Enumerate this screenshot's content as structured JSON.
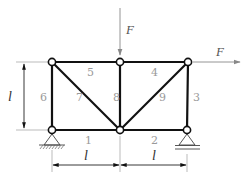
{
  "diagram": {
    "type": "truss",
    "colors": {
      "member": "#111111",
      "force": "#888888",
      "dimension": "#222222",
      "label": "#9a9a9a",
      "extension": "#aaaaaa"
    },
    "nodes": [
      {
        "id": "A",
        "x": 52,
        "y": 62
      },
      {
        "id": "B",
        "x": 120,
        "y": 62
      },
      {
        "id": "C",
        "x": 188,
        "y": 62
      },
      {
        "id": "D",
        "x": 52,
        "y": 130
      },
      {
        "id": "E",
        "x": 120,
        "y": 130
      },
      {
        "id": "G",
        "x": 187,
        "y": 130
      }
    ],
    "members": [
      {
        "label": "1",
        "from": "D",
        "to": "E"
      },
      {
        "label": "2",
        "from": "E",
        "to": "G"
      },
      {
        "label": "3",
        "from": "C",
        "to": "G"
      },
      {
        "label": "4",
        "from": "B",
        "to": "C"
      },
      {
        "label": "5",
        "from": "A",
        "to": "B"
      },
      {
        "label": "6",
        "from": "A",
        "to": "D"
      },
      {
        "label": "7",
        "from": "A",
        "to": "E"
      },
      {
        "label": "8",
        "from": "B",
        "to": "E"
      },
      {
        "label": "9",
        "from": "C",
        "to": "E"
      }
    ],
    "member_labels": {
      "m1": "1",
      "m2": "2",
      "m3": "3",
      "m4": "4",
      "m5": "5",
      "m6": "6",
      "m7": "7",
      "m8": "8",
      "m9": "9"
    },
    "loads": [
      {
        "label": "F",
        "at": "B",
        "direction": "down"
      },
      {
        "label": "F",
        "at": "C",
        "direction": "right"
      }
    ],
    "load_labels": {
      "vertical": "F",
      "horizontal": "F"
    },
    "supports": [
      {
        "at": "D",
        "type": "pinned"
      },
      {
        "at": "G",
        "type": "roller"
      }
    ],
    "dimensions": {
      "height": "l",
      "left_span": "l",
      "right_span": "l"
    }
  }
}
